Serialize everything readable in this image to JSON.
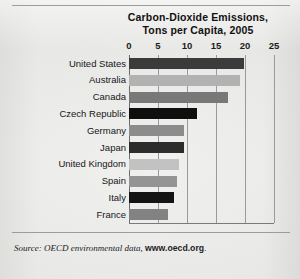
{
  "figure": {
    "title_line1": "Carbon-Dioxide Emissions,",
    "title_line2": "Tons per Capita, 2005",
    "source_prefix": "Source: OECD environmental data,",
    "source_link": "www.oecd.org",
    "source_suffix": "."
  },
  "chart_data": {
    "type": "bar",
    "orientation": "horizontal",
    "title": "Carbon-Dioxide Emissions, Tons per Capita, 2005",
    "xlabel": "",
    "ylabel": "",
    "xlim": [
      0,
      25
    ],
    "xticks": [
      0,
      5,
      10,
      15,
      20,
      25
    ],
    "xtick_labels": [
      "0",
      "5",
      "10",
      "15",
      "20",
      "25"
    ],
    "grid": "vertical",
    "legend": "none",
    "categories": [
      "United States",
      "Australia",
      "Canada",
      "Czech Republic",
      "Germany",
      "Japan",
      "United Kingdom",
      "Spain",
      "Italy",
      "France"
    ],
    "values": [
      19.9,
      19.2,
      17.1,
      11.7,
      9.4,
      9.4,
      8.7,
      8.3,
      7.8,
      6.8
    ],
    "bar_colors": [
      "#3b3b3b",
      "#b2b2b2",
      "#787878",
      "#0e0e0e",
      "#8c8c8c",
      "#2c2c2c",
      "#c2c2c2",
      "#949494",
      "#141414",
      "#828282"
    ]
  }
}
